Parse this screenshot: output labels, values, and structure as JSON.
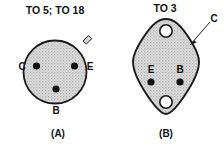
{
  "figure": {
    "background_color": "#ffffff",
    "outline_color": "#1a1a1a",
    "body_fill_color": "#d4d4d4",
    "pin_color": "#111111",
    "hole_fill_color": "#ffffff"
  },
  "packages": [
    {
      "id": "to5-to18",
      "header": "TO 5; TO 18",
      "caption": "(A)",
      "outline": "circle",
      "has_index_tab": true,
      "pins": [
        {
          "name": "C",
          "label": "C",
          "position": "left"
        },
        {
          "name": "E",
          "label": "E",
          "position": "right"
        },
        {
          "name": "B",
          "label": "B",
          "position": "bottom"
        }
      ]
    },
    {
      "id": "to3",
      "header": "TO 3",
      "caption": "(B)",
      "outline": "diamond-oval",
      "mounting_holes": 2,
      "pins": [
        {
          "name": "E",
          "label": "E",
          "position": "left"
        },
        {
          "name": "B",
          "label": "B",
          "position": "right"
        }
      ],
      "callout": {
        "label": "C",
        "meaning": "case-is-collector"
      }
    }
  ]
}
